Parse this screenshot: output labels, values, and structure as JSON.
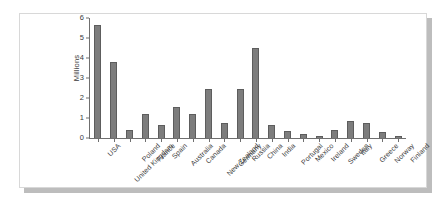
{
  "chart_data": {
    "type": "bar",
    "title": "",
    "subtitle": "",
    "xlabel": "",
    "ylabel": "Millions",
    "ylim": [
      0,
      6
    ],
    "yticks": [
      0,
      1,
      2,
      3,
      4,
      5,
      6
    ],
    "ytick_labels": [
      "0",
      "1",
      "2",
      "3",
      "4",
      "5",
      "6"
    ],
    "grid": false,
    "legend": false,
    "legend_position": "none",
    "bar_color": "#7d7d7d",
    "bar_edge_color": "#5d5d5d",
    "axis_color": "#6f6f6f",
    "background_color": "#ffffff",
    "categories": [
      "USA",
      "United Kingdom",
      "Poland",
      "France",
      "Spain",
      "Australia",
      "Canada",
      "New Zealand",
      "Germany",
      "Russia",
      "China",
      "India",
      "Portugal",
      "Mexico",
      "Ireland",
      "Sweden",
      "Italy",
      "Greece",
      "Norway",
      "Finland"
    ],
    "values": [
      5.65,
      3.8,
      0.4,
      1.18,
      0.63,
      1.55,
      1.18,
      2.47,
      0.77,
      2.47,
      4.5,
      0.63,
      0.35,
      0.18,
      0.12,
      0.42,
      0.83,
      0.73,
      0.28,
      0.1
    ]
  },
  "figure": {
    "shadow_color": "#bdbdbd",
    "card_border_color": "#d8d8d8"
  }
}
